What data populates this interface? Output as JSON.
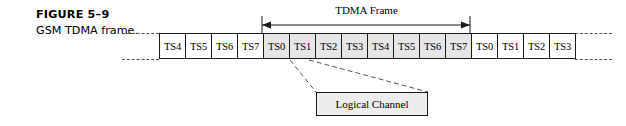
{
  "figure": {
    "label": "FIGURE 5–9",
    "title": "GSM TDMA frame."
  },
  "frame_measure": {
    "label": "TDMA Frame"
  },
  "callout": {
    "label": "Logical Channel"
  },
  "colors": {
    "shaded_slot": "#e6e6e6",
    "callout_fill": "#ececec",
    "line": "#1a1a1a",
    "dashed": "#555555"
  },
  "timeline": {
    "slots": [
      {
        "label": "TS4",
        "shaded": false
      },
      {
        "label": "TS5",
        "shaded": false
      },
      {
        "label": "TS6",
        "shaded": false
      },
      {
        "label": "TS7",
        "shaded": false
      },
      {
        "label": "TS0",
        "shaded": true
      },
      {
        "label": "TS1",
        "shaded": true
      },
      {
        "label": "TS2",
        "shaded": true
      },
      {
        "label": "TS3",
        "shaded": true
      },
      {
        "label": "TS4",
        "shaded": true
      },
      {
        "label": "TS5",
        "shaded": true
      },
      {
        "label": "TS6",
        "shaded": true
      },
      {
        "label": "TS7",
        "shaded": true
      },
      {
        "label": "TS0",
        "shaded": false
      },
      {
        "label": "TS1",
        "shaded": false
      },
      {
        "label": "TS2",
        "shaded": false
      },
      {
        "label": "TS3",
        "shaded": false
      }
    ]
  }
}
